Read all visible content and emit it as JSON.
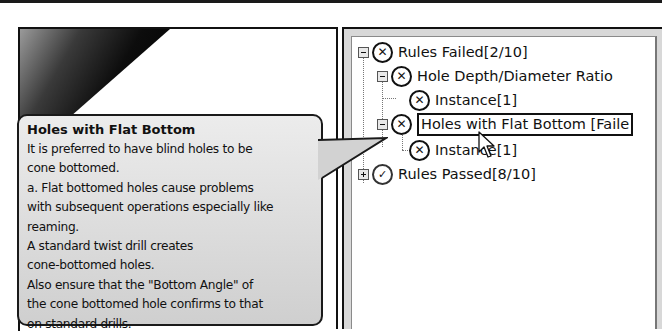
{
  "tooltip": {
    "title": "Holes with Flat Bottom",
    "lines": [
      "It is preferred to have blind holes to be",
      "cone bottomed.",
      "a. Flat bottomed holes cause problems",
      "with subsequent operations especially like",
      "reaming.",
      "A standard twist drill creates",
      "cone-bottomed holes.",
      "Also ensure that the \"Bottom Angle\" of",
      "the cone bottomed hole confirms to that",
      "on standard drills."
    ]
  },
  "tree": {
    "items": [
      {
        "label": "Rules Failed[2/10]",
        "status": "failed",
        "status_icon": "x-circle-icon",
        "expander": "collapse",
        "level": 0
      },
      {
        "label": "Hole Depth/Diameter Ratio",
        "status": "failed",
        "status_icon": "x-circle-icon",
        "expander": "collapse",
        "level": 1
      },
      {
        "label": "Instance[1]",
        "status": "failed",
        "status_icon": "x-circle-icon",
        "expander": "none",
        "level": 2
      },
      {
        "label": "Holes with Flat Bottom [Faile",
        "status": "failed",
        "status_icon": "x-circle-icon",
        "expander": "collapse",
        "level": 1,
        "selected": true
      },
      {
        "label": "Instance[1]",
        "status": "failed",
        "status_icon": "x-circle-icon",
        "expander": "none",
        "level": 2
      },
      {
        "label": "Rules Passed[8/10]",
        "status": "passed",
        "status_icon": "check-circle-icon",
        "expander": "expand",
        "level": 0
      }
    ],
    "glyphs": {
      "failed": "✕",
      "passed": "✓"
    }
  }
}
